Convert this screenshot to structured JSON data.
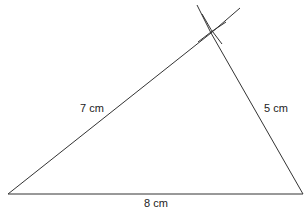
{
  "diagram": {
    "type": "triangle construction",
    "vertices": {
      "A": [
        8,
        194
      ],
      "B": [
        303,
        194
      ],
      "C": [
        211,
        33
      ]
    },
    "sides": [
      {
        "from": "A",
        "to": "B",
        "label": "8 cm"
      },
      {
        "from": "A",
        "to": "C",
        "label": "7 cm"
      },
      {
        "from": "B",
        "to": "C",
        "label": "5 cm"
      }
    ],
    "construction_arcs": "two intersecting arcs at apex C",
    "stroke_color": "#333333"
  },
  "labels": {
    "base": "8 cm",
    "left": "7 cm",
    "right": "5 cm"
  }
}
